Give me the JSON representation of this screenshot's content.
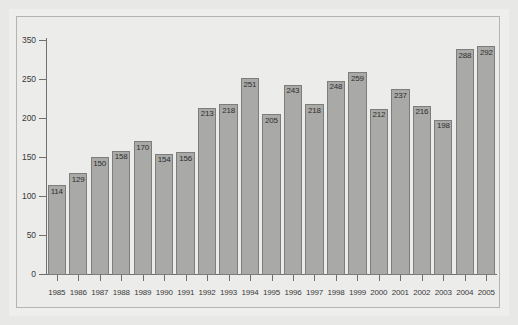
{
  "chart_data": {
    "type": "bar",
    "title": "",
    "subtitle": "",
    "xlabel": "",
    "ylabel": "",
    "categories": [
      "1985",
      "1986",
      "1987",
      "1988",
      "1989",
      "1990",
      "1991",
      "1992",
      "1993",
      "1994",
      "1995",
      "1996",
      "1997",
      "1998",
      "1999",
      "2000",
      "2001",
      "2002",
      "2003",
      "2004",
      "2005"
    ],
    "values": [
      114,
      129,
      150,
      158,
      170,
      154,
      156,
      213,
      218,
      251,
      205,
      243,
      218,
      248,
      259,
      212,
      237,
      216,
      198,
      288,
      292
    ],
    "data_labels": [
      "114",
      "129",
      "150",
      "158",
      "170",
      "154",
      "156",
      "213",
      "218",
      "251",
      "205",
      "243",
      "218",
      "248",
      "259",
      "212",
      "237",
      "216",
      "198",
      "288",
      "292"
    ],
    "y_tick_labels": [
      "350",
      "250",
      "200",
      "150",
      "100",
      "50",
      "0"
    ],
    "y_tick_values": [
      300,
      250,
      200,
      150,
      100,
      50,
      0
    ],
    "ylim": [
      0,
      300
    ],
    "grid": false,
    "legend": null,
    "legend_position": "none",
    "colors": {
      "bar_fill": "#a9a9a7",
      "bar_stroke": "#7d7d7b",
      "axis": "#6f6f6f",
      "text": "#3a3a3a",
      "plot_background": "#ececea",
      "page_background": "#e8e8e7",
      "frame_border": "#b4b4b2"
    }
  }
}
